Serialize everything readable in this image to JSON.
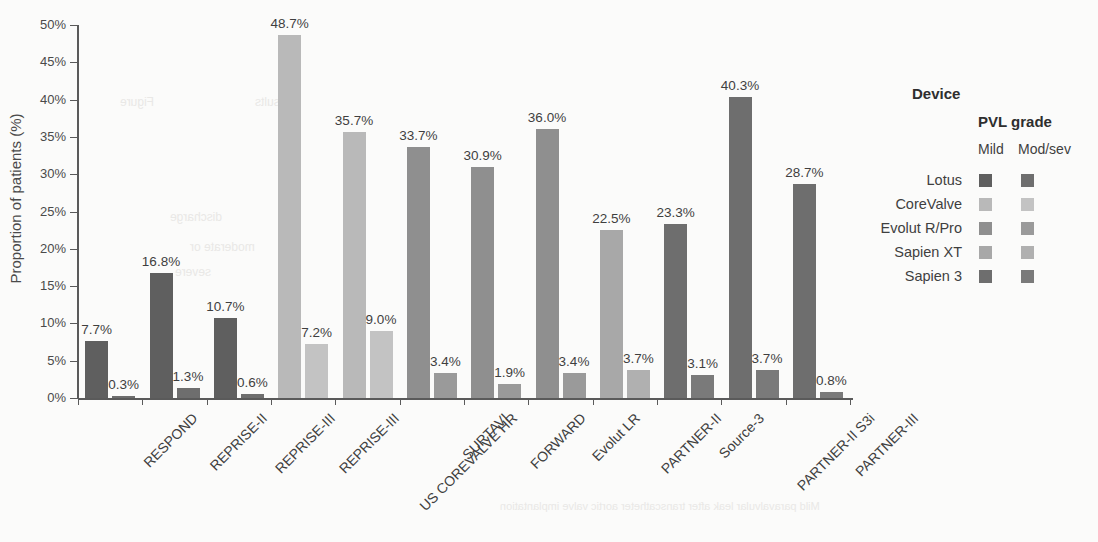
{
  "chart_data": {
    "type": "bar",
    "title": "",
    "xlabel": "",
    "ylabel": "Proportion of patients (%)",
    "ylim": [
      0,
      50
    ],
    "ytick_labels": [
      "0%",
      "5%",
      "10%",
      "15%",
      "20%",
      "25%",
      "30%",
      "35%",
      "40%",
      "45%",
      "50%"
    ],
    "ytick_values": [
      0,
      5,
      10,
      15,
      20,
      25,
      30,
      35,
      40,
      45,
      50
    ],
    "grid": false,
    "legend_position": "right",
    "value_suffix": "%",
    "categories": [
      "RESPOND",
      "REPRISE-II",
      "REPRISE-III",
      "REPRISE-III",
      "US COREVALVE HR",
      "SURTAVI",
      "FORWARD",
      "Evolut LR",
      "PARTNER-II",
      "Source-3",
      "PARTNER-II S3i",
      "PARTNER-III"
    ],
    "category_devices": [
      "Lotus",
      "Lotus",
      "Lotus",
      "CoreValve",
      "CoreValve",
      "Evolut R/Pro",
      "Evolut R/Pro",
      "Evolut R/Pro",
      "Sapien XT",
      "Sapien 3",
      "Sapien 3",
      "Sapien 3"
    ],
    "series": [
      {
        "name": "Mild",
        "values": [
          7.7,
          16.8,
          10.7,
          48.7,
          35.7,
          33.7,
          30.9,
          36.0,
          22.5,
          23.3,
          40.3,
          28.7
        ],
        "labels": [
          "7.7%",
          "16.8%",
          "10.7%",
          "48.7%",
          "35.7%",
          "33.7%",
          "30.9%",
          "36.0%",
          "22.5%",
          "23.3%",
          "40.3%",
          "28.7%"
        ]
      },
      {
        "name": "Mod/sev",
        "values": [
          0.3,
          1.3,
          0.6,
          7.2,
          9.0,
          3.4,
          1.9,
          3.4,
          3.7,
          3.1,
          3.7,
          0.8
        ],
        "labels": [
          "0.3%",
          "1.3%",
          "0.6%",
          "7.2%",
          "9.0%",
          "3.4%",
          "1.9%",
          "3.4%",
          "3.7%",
          "3.1%",
          "3.7%",
          "0.8%"
        ]
      }
    ],
    "device_colors": {
      "Lotus": {
        "mild": "#5f5f5f",
        "mod": "#6e6e6e"
      },
      "CoreValve": {
        "mild": "#b9b9b9",
        "mod": "#c3c3c3"
      },
      "Evolut R/Pro": {
        "mild": "#8f8f8f",
        "mod": "#9a9a9a"
      },
      "Sapien XT": {
        "mild": "#a8a8a8",
        "mod": "#b0b0b0"
      },
      "Sapien 3": {
        "mild": "#6e6e6e",
        "mod": "#7a7a7a"
      }
    }
  },
  "legend": {
    "device_title": "Device",
    "pvl_title": "PVL grade",
    "sub_mild": "Mild",
    "sub_modsev": "Mod/sev",
    "items": [
      {
        "label": "Lotus",
        "mild": "#5f5f5f",
        "mod": "#6e6e6e"
      },
      {
        "label": "CoreValve",
        "mild": "#b9b9b9",
        "mod": "#c3c3c3"
      },
      {
        "label": "Evolut R/Pro",
        "mild": "#8f8f8f",
        "mod": "#9a9a9a"
      },
      {
        "label": "Sapien XT",
        "mild": "#a8a8a8",
        "mod": "#b0b0b0"
      },
      {
        "label": "Sapien 3",
        "mild": "#6e6e6e",
        "mod": "#7a7a7a"
      }
    ]
  },
  "artifacts": {
    "bleed_lines": [
      "Mild paravalvular leak after transcatheter aortic valve implantation",
      "Figure",
      "Results",
      "discharge",
      "moderate or",
      "severe"
    ]
  }
}
